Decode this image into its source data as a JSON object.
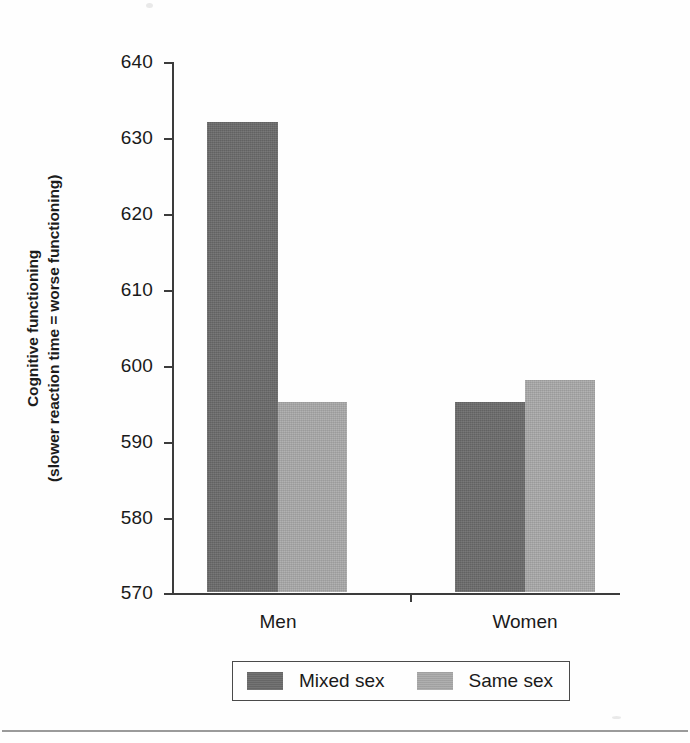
{
  "chart_data": {
    "type": "bar",
    "title": "",
    "xlabel": "",
    "ylabel": "Cognitive functioning (slower reaction time = worse functioning)",
    "ylabel_line1": "Cognitive functioning",
    "ylabel_line2": "(slower reaction time = worse functioning)",
    "categories": [
      "Men",
      "Women"
    ],
    "series": [
      {
        "name": "Mixed sex",
        "values": [
          632,
          595
        ],
        "color": "#6b6b6b"
      },
      {
        "name": "Same sex",
        "values": [
          595,
          598
        ],
        "color": "#a9a9a9"
      }
    ],
    "ylim": [
      570,
      640
    ],
    "ytick_step": 10,
    "yticks": [
      "640",
      "630",
      "620",
      "610",
      "600",
      "590",
      "580",
      "570"
    ],
    "ytick_values": [
      640,
      630,
      620,
      610,
      600,
      590,
      580,
      570
    ],
    "grid": false,
    "legend_position": "bottom"
  },
  "legend": {
    "items": [
      {
        "label": "Mixed sex",
        "color": "#6b6b6b"
      },
      {
        "label": "Same sex",
        "color": "#a9a9a9"
      }
    ]
  },
  "axis": {
    "categories": [
      "Men",
      "Women"
    ]
  },
  "colors": {
    "mixed_sex": "#6b6b6b",
    "same_sex": "#a9a9a9",
    "axis": "#3c3c3c",
    "text": "#1a1a1a"
  }
}
